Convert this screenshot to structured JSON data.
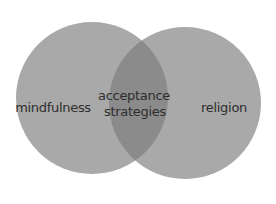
{
  "diagram": {
    "type": "venn",
    "sets": [
      {
        "id": "left",
        "label": "mindfulness",
        "cx": 92,
        "cy": 98,
        "r": 76,
        "color": "#a8a8a8"
      },
      {
        "id": "right",
        "label": "religion",
        "cx": 185,
        "cy": 103,
        "r": 76,
        "color": "#a8a8a8"
      }
    ],
    "intersection": {
      "label_line1": "acceptance",
      "label_line2": "strategies",
      "color": "#8a8a8a"
    },
    "text_color": "#2e2e2e"
  }
}
